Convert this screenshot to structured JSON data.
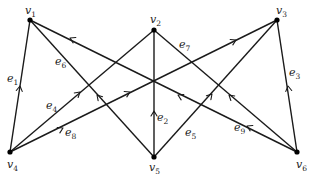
{
  "diagram": {
    "type": "directed-graph",
    "vertices": [
      {
        "id": "v1",
        "name": "v",
        "sub": "1",
        "x": 30,
        "y": 20,
        "lx": 25,
        "ly": 14
      },
      {
        "id": "v2",
        "name": "v",
        "sub": "2",
        "x": 154,
        "y": 30,
        "lx": 150,
        "ly": 23
      },
      {
        "id": "v3",
        "name": "v",
        "sub": "3",
        "x": 277,
        "y": 20,
        "lx": 276,
        "ly": 14
      },
      {
        "id": "v4",
        "name": "v",
        "sub": "4",
        "x": 10,
        "y": 152,
        "lx": 7,
        "ly": 168
      },
      {
        "id": "v5",
        "name": "v",
        "sub": "5",
        "x": 154,
        "y": 157,
        "lx": 149,
        "ly": 171
      },
      {
        "id": "v6",
        "name": "v",
        "sub": "6",
        "x": 297,
        "y": 152,
        "lx": 296,
        "ly": 168
      }
    ],
    "edges": [
      {
        "id": "e1",
        "name": "e",
        "sub": "1",
        "from": "v4",
        "to": "v1",
        "lx": 7,
        "ly": 82,
        "arrows": [
          [
            20,
            86
          ]
        ]
      },
      {
        "id": "e2",
        "name": "e",
        "sub": "2",
        "from": "v5",
        "to": "v2",
        "lx": 157,
        "ly": 121,
        "arrows": [
          [
            154,
            111
          ]
        ]
      },
      {
        "id": "e3",
        "name": "e",
        "sub": "3",
        "from": "v6",
        "to": "v3",
        "lx": 289,
        "ly": 76,
        "arrows": [
          [
            288,
            86
          ]
        ]
      },
      {
        "id": "e4",
        "name": "e",
        "sub": "4",
        "from": "v4",
        "to": "v2",
        "lx": 46,
        "ly": 109,
        "arrows": [
          [
            80,
            92
          ]
        ]
      },
      {
        "id": "e5",
        "name": "e",
        "sub": "5",
        "from": "v5",
        "to": "v3",
        "lx": 185,
        "ly": 136,
        "arrows": [
          [
            212,
            94
          ]
        ]
      },
      {
        "id": "e6",
        "name": "e",
        "sub": "6",
        "from": "v5",
        "to": "v1",
        "lx": 55,
        "ly": 65,
        "arrows": [
          [
            97,
            95
          ]
        ]
      },
      {
        "id": "e7",
        "name": "e",
        "sub": "7",
        "from": "v6",
        "to": "v2",
        "lx": 179,
        "ly": 48,
        "arrows": [
          [
            229,
            95
          ]
        ]
      },
      {
        "id": "e8",
        "name": "e",
        "sub": "8",
        "from": "v4",
        "to": "v3",
        "lx": 65,
        "ly": 136,
        "arrows": [
          [
            63,
            128
          ],
          [
            130,
            92
          ],
          [
            236,
            40
          ]
        ]
      },
      {
        "id": "e9",
        "name": "e",
        "sub": "9",
        "from": "v6",
        "to": "v1",
        "lx": 234,
        "ly": 131,
        "arrows": [
          [
            70,
            38
          ],
          [
            178,
            95
          ],
          [
            247,
            126
          ]
        ]
      }
    ]
  }
}
